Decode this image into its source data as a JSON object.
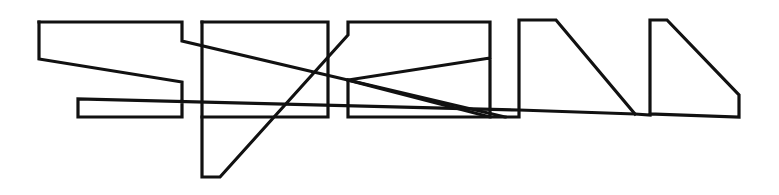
{
  "figure": {
    "width": 779,
    "height": 195,
    "background": "#ffffff",
    "stroke_color": "#111111",
    "stroke_width": 3.2
  },
  "paths": [
    {
      "name": "left-shape-outline",
      "points": "39,22 182,22 182,41 505,117 519,117 519,20 556,20 635,114"
    },
    {
      "name": "left-shape-lower",
      "points": "39,22 39,59 182,82 182,117 78,117 78,99 519,110 635,114 650,115 650,20 667,20 739,95 739,117 650,114"
    },
    {
      "name": "middle-shape-a",
      "points": "202,22 328,22 328,117 202,117"
    },
    {
      "name": "middle-shape-b",
      "points": "202,22 202,177 220,177 348,35 348,22 490,22 490,117 348,117 348,80 490,58"
    },
    {
      "name": "cross-diagonal",
      "points": "348,80 490,117 505,117"
    }
  ]
}
